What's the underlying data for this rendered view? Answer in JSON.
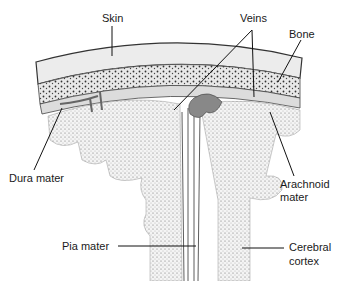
{
  "diagram": {
    "labels": {
      "skin": "Skin",
      "veins": "Veins",
      "bone": "Bone",
      "dura": "Dura mater",
      "arachnoid_1": "Arachnoid",
      "arachnoid_2": "mater",
      "pia": "Pia mater",
      "cortex_1": "Cerebral",
      "cortex_2": "cortex"
    }
  }
}
